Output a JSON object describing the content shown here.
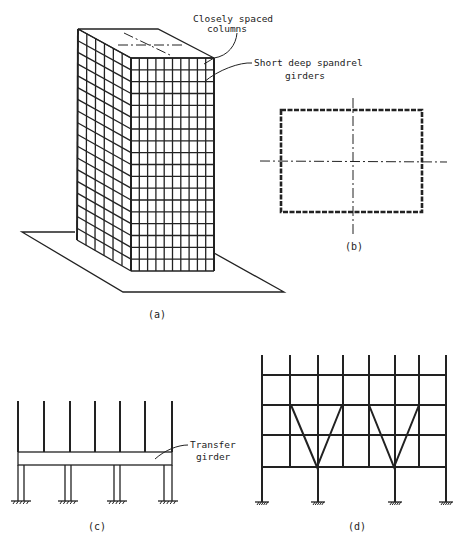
{
  "figure": {
    "panels": [
      {
        "id": "a",
        "caption": "(a)",
        "title": "Framed tube building (isometric)"
      },
      {
        "id": "b",
        "caption": "(b)",
        "title": "Plan"
      },
      {
        "id": "c",
        "caption": "(c)",
        "title": "Transfer girder elevation"
      },
      {
        "id": "d",
        "caption": "(d)",
        "title": "Braced transfer elevation"
      }
    ],
    "annotations": {
      "closely_spaced_columns": [
        "Closely spaced",
        "columns"
      ],
      "short_deep_spandrel": [
        "Short deep spandrel",
        "girders"
      ],
      "transfer_girder": [
        "Transfer",
        "girder"
      ]
    },
    "building": {
      "front_columns": 10,
      "side_columns": 6,
      "stories": 18
    },
    "panel_c": {
      "upper_columns_x": [
        18,
        44,
        70,
        95,
        120,
        145,
        172
      ],
      "lower_column_pairs_x": [
        [
          18,
          24
        ],
        [
          65,
          71
        ],
        [
          114,
          120
        ],
        [
          164,
          172
        ]
      ]
    },
    "panel_d": {
      "columns_x": [
        262,
        290,
        318,
        343,
        369,
        395,
        419,
        446
      ],
      "beams_y": [
        375,
        405,
        435,
        467
      ],
      "base_columns_x": [
        262,
        318,
        395,
        446
      ]
    }
  }
}
